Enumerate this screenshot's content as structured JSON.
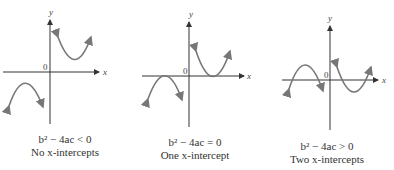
{
  "figure": {
    "panels": [
      {
        "id": "no-intercepts",
        "condition": "b² − 4ac < 0",
        "caption": "No x-intercepts",
        "axis_labels": {
          "x": "x",
          "y": "y",
          "origin": "0"
        }
      },
      {
        "id": "one-intercept",
        "condition": "b² − 4ac = 0",
        "caption": "One x-intercept",
        "axis_labels": {
          "x": "x",
          "y": "y",
          "origin": "0"
        }
      },
      {
        "id": "two-intercepts",
        "condition": "b² − 4ac > 0",
        "caption": "Two x-intercepts",
        "axis_labels": {
          "x": "x",
          "y": "y",
          "origin": "0"
        }
      }
    ],
    "colors": {
      "axis": "#333333",
      "curve": "#777777",
      "text": "#333333"
    }
  }
}
